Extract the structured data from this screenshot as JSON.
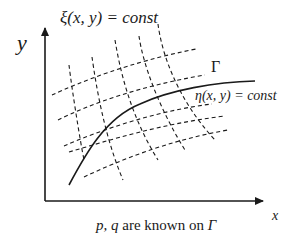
{
  "diagram": {
    "axes": {
      "x_label": "x",
      "y_label": "y"
    },
    "labels": {
      "xi_curve": "ξ(x, y) = const",
      "eta_curve": "η(x, y) = const",
      "boundary": "Γ"
    },
    "caption": {
      "vars": "p, q",
      "middle": " are known on ",
      "gamma": "Γ"
    },
    "colors": {
      "line": "#1a1a1a",
      "background": "#ffffff"
    },
    "elements": {
      "solid_curve": "boundary curve Γ (solid)",
      "dashed_xi_lines": 5,
      "dashed_eta_lines": 5
    }
  }
}
